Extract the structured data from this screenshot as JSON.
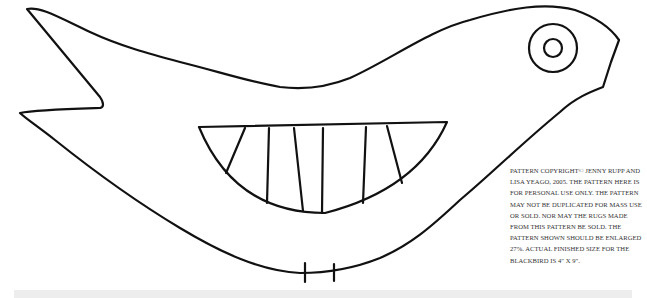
{
  "pattern": {
    "subject": "blackbird",
    "parts": {
      "body_outline": "body-outline",
      "eye_outer": "eye-outer-ring",
      "eye_inner": "eye-pupil",
      "wing": "wing",
      "legs": "leg-marks"
    },
    "colors": {
      "line": "#111111",
      "background": "#ffffff",
      "text": "#333333",
      "band": "#ededed"
    }
  },
  "notice": {
    "text": "PATTERN COPYRIGHT© JENNY RUPP AND LISA YEAGO, 2005. THE PATTERN HERE IS FOR PERSONAL USE ONLY. THE PATTERN MAY NOT BE DUPLICATED FOR MASS USE OR SOLD. NOR MAY THE RUGS MADE FROM THIS PATTERN BE SOLD. THE PATTERN SHOWN SHOULD BE ENLARGED 27%. ACTUAL FINISHED SIZE FOR THE BLACKBIRD IS 4\" X 9\"."
  }
}
